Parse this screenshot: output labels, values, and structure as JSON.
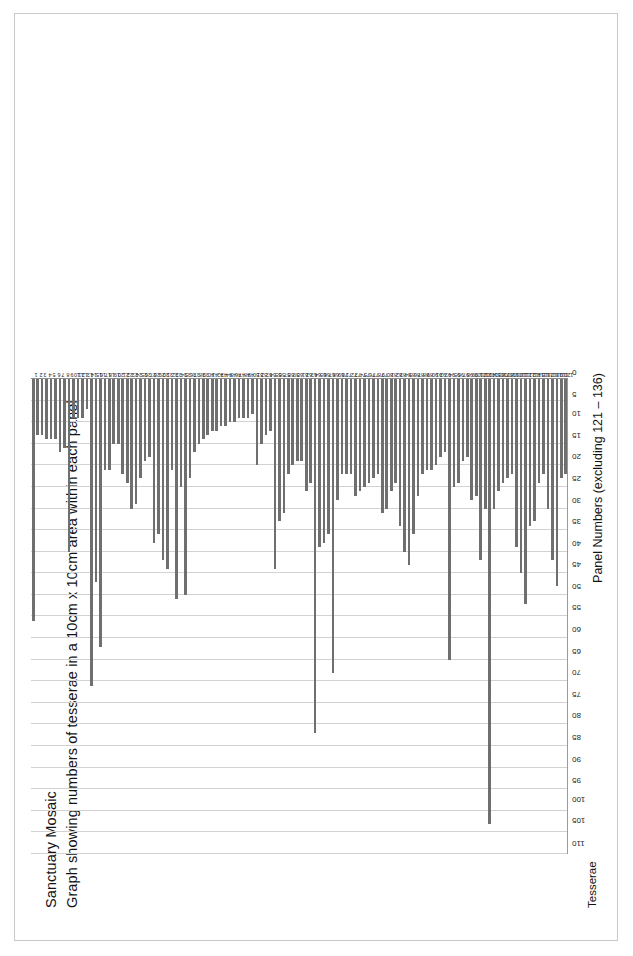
{
  "document": {
    "title_lines": [
      "Sanctuary Mosaic",
      "Graph showing numbers of tesserae in a 10cm x 10cm area within each panel"
    ]
  },
  "chart_data": {
    "type": "bar",
    "orientation": "horizontal",
    "subtitle": "Graph showing numbers of tesserae in a 10cm x 10cm area within each panel",
    "xlabel": "Panel Numbers (excluding 121 – 136)",
    "ylabel": "Tesserae",
    "value_axis_label": "Tesserae",
    "category_axis_label": "Panel Numbers (excluding 121 – 136)",
    "grid": true,
    "legend": false,
    "legend_position": "none",
    "value_axis_ticks": [
      0,
      5,
      10,
      15,
      20,
      25,
      30,
      35,
      40,
      45,
      50,
      55,
      60,
      65,
      70,
      75,
      80,
      85,
      90,
      95,
      100,
      105,
      110
    ],
    "value_axis_tick_labels": [
      "0",
      "5",
      "10",
      "15",
      "20",
      "25",
      "30",
      "35",
      "40",
      "45",
      "50",
      "55",
      "60",
      "65",
      "70",
      "75",
      "80",
      "85",
      "90",
      "95",
      "100",
      "105",
      "110"
    ],
    "ylim": [
      0,
      110
    ],
    "axis_direction": "value axis increases right-to-left; 0 at right edge",
    "categories": [
      "1",
      "2",
      "3",
      "4",
      "5",
      "6",
      "7",
      "8",
      "9",
      "10",
      "11",
      "12",
      "13",
      "14",
      "15",
      "16",
      "17",
      "18",
      "19",
      "20",
      "21",
      "22",
      "23",
      "24",
      "25",
      "26",
      "27",
      "28",
      "29",
      "30",
      "31",
      "32",
      "33",
      "34",
      "35",
      "36",
      "37",
      "38",
      "39",
      "40",
      "41",
      "42",
      "43",
      "44",
      "45",
      "46",
      "47",
      "48",
      "49",
      "50",
      "51",
      "52",
      "53",
      "54",
      "55",
      "56",
      "57",
      "58",
      "59",
      "60",
      "61",
      "62",
      "63",
      "64",
      "65",
      "66",
      "67",
      "68",
      "69",
      "70",
      "71",
      "72",
      "73",
      "74",
      "75",
      "76",
      "77",
      "78",
      "79",
      "80",
      "81",
      "82",
      "83",
      "84",
      "85",
      "86",
      "87",
      "88",
      "89",
      "90",
      "91",
      "92",
      "93",
      "94",
      "95",
      "96",
      "97",
      "98",
      "99",
      "100",
      "101",
      "102",
      "103",
      "104",
      "105",
      "106",
      "107",
      "108",
      "109",
      "110",
      "111",
      "112",
      "113",
      "114",
      "115",
      "116",
      "117",
      "118",
      "119",
      "120"
    ],
    "values": [
      56,
      13,
      13,
      14,
      14,
      14,
      17,
      16,
      40,
      9,
      9,
      9,
      7,
      71,
      47,
      62,
      21,
      21,
      15,
      15,
      22,
      24,
      30,
      29,
      23,
      19,
      18,
      38,
      36,
      42,
      44,
      21,
      51,
      25,
      50,
      23,
      17,
      15,
      14,
      13,
      12,
      12,
      11,
      11,
      10,
      10,
      9,
      9,
      9,
      8,
      20,
      15,
      13,
      12,
      44,
      33,
      31,
      22,
      20,
      19,
      19,
      26,
      24,
      82,
      39,
      38,
      36,
      68,
      28,
      22,
      22,
      22,
      27,
      26,
      25,
      24,
      23,
      22,
      31,
      30,
      26,
      24,
      34,
      40,
      43,
      36,
      27,
      22,
      21,
      21,
      20,
      18,
      17,
      65,
      25,
      24,
      19,
      18,
      28,
      27,
      42,
      30,
      103,
      30,
      26,
      24,
      23,
      22,
      39,
      45,
      52,
      34,
      33,
      24,
      22,
      30,
      42,
      48,
      23,
      22
    ],
    "bar_color": "#6f6f6f",
    "grid_color": "#d2d2d2",
    "axis_color": "#8c8c8c"
  }
}
